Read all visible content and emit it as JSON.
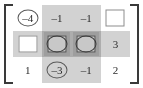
{
  "figure": {
    "name": "matrix-with-highlighted-rows-and-columns",
    "rows": 3,
    "cols": 4,
    "bracket_style": "square",
    "colors": {
      "text": "#2b2b2b",
      "bracket": "#3a3a3a",
      "highlight": "#d2d2d2",
      "intersection": "#9e9e9e",
      "box_border": "#8d8d8d",
      "circle_border": "#5a5a5a",
      "background": "#ffffff"
    },
    "highlighted_columns": [
      2,
      3
    ],
    "highlighted_rows": [
      2
    ]
  },
  "matrix": {
    "cells": [
      [
        {
          "value": "–4",
          "marker": "circle"
        },
        {
          "value": "–1",
          "marker": "none"
        },
        {
          "value": "–1",
          "marker": "none"
        },
        {
          "value": "5",
          "marker": "box"
        }
      ],
      [
        {
          "value": "3",
          "marker": "box"
        },
        {
          "value": "0",
          "marker": "circle-box"
        },
        {
          "value": "0",
          "marker": "circle-box"
        },
        {
          "value": "3",
          "marker": "none"
        }
      ],
      [
        {
          "value": "1",
          "marker": "none"
        },
        {
          "value": "–3",
          "marker": "circle"
        },
        {
          "value": "–1",
          "marker": "none"
        },
        {
          "value": "2",
          "marker": "none"
        }
      ]
    ]
  }
}
